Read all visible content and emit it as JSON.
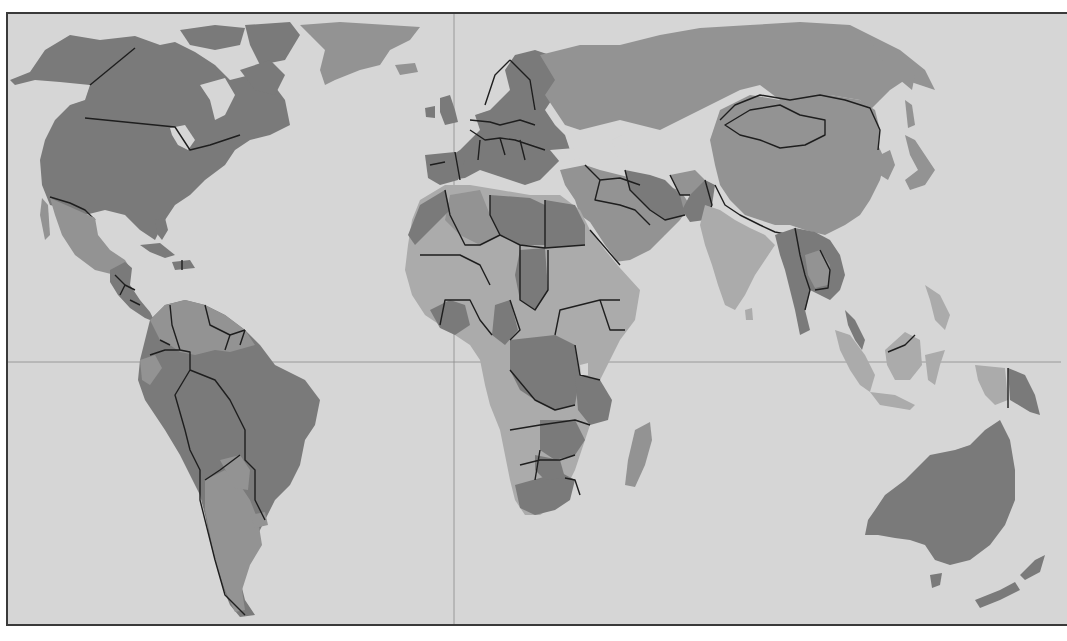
{
  "map": {
    "type": "political-world-map",
    "style": "grayscale",
    "projection_lines": {
      "equator": {
        "y": 362,
        "visible": true
      },
      "prime_meridian": {
        "x": 454,
        "visible": true
      }
    },
    "colors": {
      "ocean": "#d6d6d6",
      "land_dark": "#7a7a7a",
      "land_mid": "#939393",
      "land_light": "#ababab",
      "border": "#1e1e1e",
      "frame": "#3a3a3a"
    },
    "regions": [
      {
        "name": "North America",
        "shade": "dark"
      },
      {
        "name": "Greenland",
        "shade": "mid"
      },
      {
        "name": "Mexico",
        "shade": "mid"
      },
      {
        "name": "Central America",
        "shade": "dark"
      },
      {
        "name": "South America",
        "shade": "dark"
      },
      {
        "name": "Europe",
        "shade": "dark"
      },
      {
        "name": "Russia",
        "shade": "mid"
      },
      {
        "name": "China",
        "shade": "mid"
      },
      {
        "name": "India",
        "shade": "light"
      },
      {
        "name": "Middle East",
        "shade": "mid"
      },
      {
        "name": "Africa",
        "shade": "mixed"
      },
      {
        "name": "Southeast Asia",
        "shade": "dark"
      },
      {
        "name": "Indonesia",
        "shade": "light"
      },
      {
        "name": "Australia",
        "shade": "dark"
      },
      {
        "name": "New Zealand",
        "shade": "dark"
      }
    ]
  }
}
